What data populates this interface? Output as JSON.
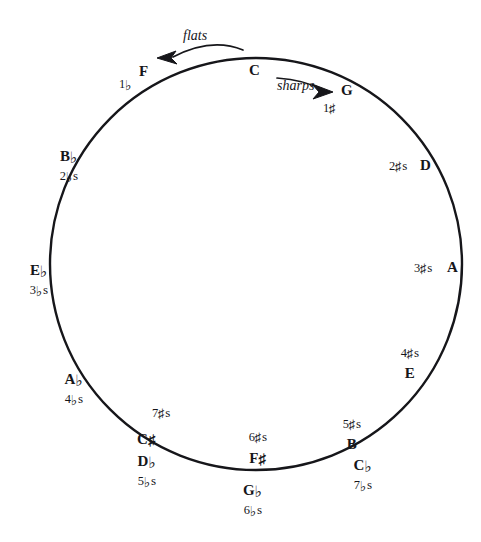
{
  "figure": {
    "kind": "circle-of-fifths",
    "background_color": "#ffffff",
    "ink_color": "#16161a",
    "circle": {
      "center_x": 256,
      "center_y": 264,
      "radius": 206,
      "stroke_width": 2.4
    }
  },
  "directions": {
    "flats": {
      "label": "flats",
      "arrow": "curved-arrow-left"
    },
    "sharps": {
      "label": "sharps",
      "arrow": "curved-arrow-right"
    }
  },
  "keys": {
    "c": {
      "note": "C",
      "count": ""
    },
    "g": {
      "note": "G",
      "count_num": "1",
      "count_acc": "♯",
      "count_suffix": ""
    },
    "d": {
      "note": "D",
      "count_num": "2",
      "count_acc": "♯",
      "count_suffix": "s"
    },
    "a": {
      "note": "A",
      "count_num": "3",
      "count_acc": "♯",
      "count_suffix": "s"
    },
    "e": {
      "note": "E",
      "count_num": "4",
      "count_acc": "♯",
      "count_suffix": "s"
    },
    "b": {
      "note": "B",
      "count_num": "5",
      "count_acc": "♯",
      "count_suffix": "s"
    },
    "fsharp": {
      "note_letter": "F",
      "note_acc": "♯",
      "count_num": "6",
      "count_acc": "♯",
      "count_suffix": "s"
    },
    "csharp": {
      "note_letter": "C",
      "note_acc": "♯",
      "count_num": "7",
      "count_acc": "♯",
      "count_suffix": "s"
    },
    "f": {
      "note": "F",
      "count_num": "1",
      "count_acc": "♭",
      "count_suffix": ""
    },
    "bflat": {
      "note_letter": "B",
      "note_acc": "♭",
      "count_num": "2",
      "count_acc": "♭",
      "count_suffix": "s"
    },
    "eflat": {
      "note_letter": "E",
      "note_acc": "♭",
      "count_num": "3",
      "count_acc": "♭",
      "count_suffix": "s"
    },
    "aflat": {
      "note_letter": "A",
      "note_acc": "♭",
      "count_num": "4",
      "count_acc": "♭",
      "count_suffix": "s"
    },
    "dflat": {
      "note_letter": "D",
      "note_acc": "♭",
      "count_num": "5",
      "count_acc": "♭",
      "count_suffix": "s"
    },
    "gflat": {
      "note_letter": "G",
      "note_acc": "♭",
      "count_num": "6",
      "count_acc": "♭",
      "count_suffix": "s"
    },
    "cflat": {
      "note_letter": "C",
      "note_acc": "♭",
      "count_num": "7",
      "count_acc": "♭",
      "count_suffix": "s"
    }
  }
}
